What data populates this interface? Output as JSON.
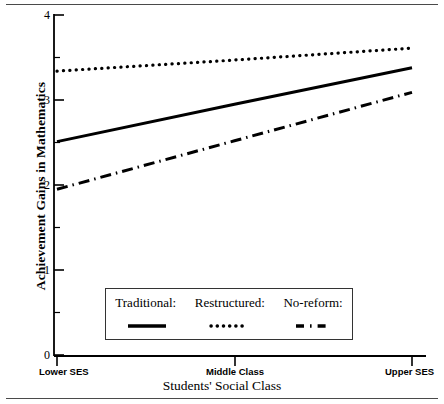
{
  "chart_data": {
    "type": "line",
    "title": "",
    "xlabel": "Students' Social Class",
    "ylabel": "Achievement Gains in Mathematics",
    "categories": [
      "Lower SES",
      "Middle Class",
      "Upper SES"
    ],
    "x": [
      0,
      1,
      2
    ],
    "xlim": [
      0,
      2
    ],
    "ylim": [
      0,
      4
    ],
    "yticks": [
      0,
      1,
      2,
      3,
      4
    ],
    "ytick_labels": [
      "0",
      "1",
      "2",
      "3",
      "4"
    ],
    "yminor_ticks": [
      0.5,
      1.5,
      2.5,
      3.5
    ],
    "grid": false,
    "legend_position": "inside-lower-center",
    "series": [
      {
        "name": "Traditional:",
        "style": "solid",
        "values": [
          2.51,
          2.95,
          3.38
        ]
      },
      {
        "name": "Restructured:",
        "style": "dotted",
        "values": [
          3.34,
          3.47,
          3.61
        ]
      },
      {
        "name": "No-reform:",
        "style": "dash-dot",
        "values": [
          1.95,
          2.52,
          3.09
        ]
      }
    ]
  },
  "axis": {
    "y_title": "Achievement Gains in Mathematics",
    "x_title": "Students' Social Class",
    "y_labels": [
      "4",
      "3",
      "2",
      "1",
      "0"
    ],
    "x_labels": [
      "Lower SES",
      "Middle Class",
      "Upper SES"
    ]
  },
  "legend": {
    "entries": [
      {
        "label": "Traditional:",
        "style": "solid"
      },
      {
        "label": "Restructured:",
        "style": "dotted"
      },
      {
        "label": "No-reform:",
        "style": "dash-dot"
      }
    ]
  }
}
